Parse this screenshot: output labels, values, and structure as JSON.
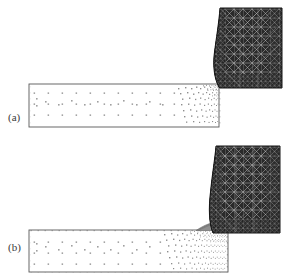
{
  "figure": {
    "caption_labels": [
      "(a)",
      "(b)"
    ],
    "background_color": "#ffffff",
    "width": 288,
    "height": 276
  },
  "panels": [
    {
      "id": "a",
      "label": "(a)",
      "description": "Initial finite element mesh of workpiece and cutting tool before cut",
      "workpiece": {
        "outline_color": "#555555",
        "fill_color": "#ffffff",
        "rect": {
          "x": 29,
          "y": 84,
          "w": 190,
          "h": 43
        },
        "coarse_node_color": "#8a8a8a",
        "refined_zone": {
          "x": 175,
          "y": 84,
          "w": 44,
          "h": 43
        },
        "chip_present": false
      },
      "tool": {
        "mesh_color": "#1d1d1d",
        "mesh_type": "unstructured-triangular",
        "bounds": {
          "x": 212,
          "y": 8,
          "w": 70,
          "h": 82
        },
        "tip_x": 219,
        "tip_y": 88
      }
    },
    {
      "id": "b",
      "label": "(b)",
      "description": "Deformed adaptive mesh showing chip formation during cutting",
      "workpiece": {
        "outline_color": "#555555",
        "fill_color": "#ffffff",
        "rect": {
          "x": 29,
          "y": 230,
          "w": 199,
          "h": 42
        },
        "coarse_node_color": "#8a8a8a",
        "refined_zone": {
          "x": 160,
          "y": 230,
          "w": 68,
          "h": 42
        },
        "chip_present": true,
        "chip_color": "#7a7a7a"
      },
      "tool": {
        "mesh_color": "#1d1d1d",
        "mesh_type": "unstructured-triangular",
        "bounds": {
          "x": 208,
          "y": 146,
          "w": 72,
          "h": 88
        },
        "tip_x": 214,
        "tip_y": 232
      }
    }
  ]
}
